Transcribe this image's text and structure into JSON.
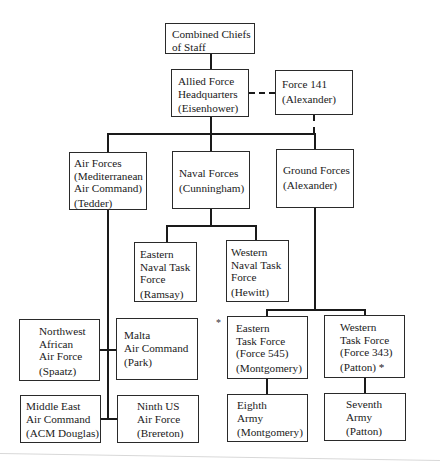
{
  "diagram": {
    "type": "organization-chart",
    "nodes": {
      "ccs": {
        "lines": [
          "Combined Chiefs",
          "of Staff"
        ],
        "person": ""
      },
      "afhq": {
        "lines": [
          "Allied Force",
          "Headquarters"
        ],
        "person": "(Eisenhower)"
      },
      "force141": {
        "lines": [
          "Force 141"
        ],
        "person": "(Alexander)"
      },
      "air": {
        "lines": [
          "Air Forces",
          "(Mediterranean",
          "Air Command)"
        ],
        "person": "(Tedder)"
      },
      "naval": {
        "lines": [
          "Naval Forces"
        ],
        "person": "(Cunningham)"
      },
      "ground": {
        "lines": [
          "Ground Forces"
        ],
        "person": "(Alexander)"
      },
      "entf": {
        "lines": [
          "Eastern",
          "Naval Task",
          "Force"
        ],
        "person": "(Ramsay)"
      },
      "wntf": {
        "lines": [
          "Western",
          "Naval Task",
          "Force"
        ],
        "person": "(Hewitt)"
      },
      "nwaaf": {
        "lines": [
          "Northwest",
          "African",
          "Air Force"
        ],
        "person": "(Spaatz)"
      },
      "malta": {
        "lines": [
          "Malta",
          "Air Command"
        ],
        "person": "(Park)"
      },
      "meac": {
        "lines": [
          "Middle East",
          "Air Command"
        ],
        "person": "(ACM Douglas)"
      },
      "ninth": {
        "lines": [
          "Ninth US",
          "Air Force"
        ],
        "person": "(Brereton)"
      },
      "etf": {
        "lines": [
          "Eastern",
          "Task Force",
          "(Force 545)"
        ],
        "person": "(Montgomery)"
      },
      "wtf": {
        "lines": [
          "Western",
          "Task Force",
          "(Force 343)"
        ],
        "person": "(Patton) *"
      },
      "eighth": {
        "lines": [
          "Eighth",
          "Army"
        ],
        "person": "(Montgomery)"
      },
      "seventh": {
        "lines": [
          "Seventh",
          "Army"
        ],
        "person": "(Patton)"
      }
    },
    "notes": {
      "asterisk": "*"
    },
    "edges": [
      {
        "from": "ccs",
        "to": "afhq",
        "style": "solid"
      },
      {
        "from": "afhq",
        "to": "force141",
        "style": "dashed"
      },
      {
        "from": "force141",
        "to": "ground",
        "style": "dashed"
      },
      {
        "from": "afhq",
        "to": "air",
        "style": "solid"
      },
      {
        "from": "afhq",
        "to": "naval",
        "style": "solid"
      },
      {
        "from": "afhq",
        "to": "ground",
        "style": "solid"
      },
      {
        "from": "naval",
        "to": "entf",
        "style": "solid"
      },
      {
        "from": "naval",
        "to": "wntf",
        "style": "solid"
      },
      {
        "from": "air",
        "to": "nwaaf",
        "style": "solid"
      },
      {
        "from": "air",
        "to": "malta",
        "style": "solid"
      },
      {
        "from": "air",
        "to": "meac",
        "style": "solid"
      },
      {
        "from": "air",
        "to": "ninth",
        "style": "solid"
      },
      {
        "from": "ground",
        "to": "etf",
        "style": "solid"
      },
      {
        "from": "ground",
        "to": "wtf",
        "style": "solid"
      },
      {
        "from": "etf",
        "to": "eighth",
        "style": "solid"
      },
      {
        "from": "wtf",
        "to": "seventh",
        "style": "solid"
      }
    ]
  }
}
